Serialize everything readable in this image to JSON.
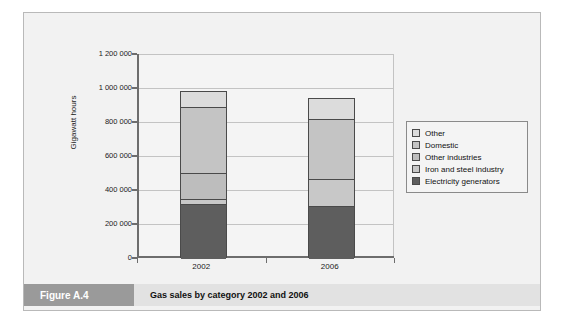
{
  "caption": {
    "tag": "Figure A.4",
    "text": "Gas sales by category 2002 and 2006"
  },
  "chart_data": {
    "type": "bar",
    "subtype": "stacked-vertical",
    "title": "Gas sales by category 2002 and 2006",
    "xlabel": "",
    "ylabel": "Gigawatt hours",
    "categories": [
      "2002",
      "2006"
    ],
    "ylim": [
      0,
      1200000
    ],
    "yticks": [
      0,
      200000,
      400000,
      600000,
      800000,
      1000000,
      1200000
    ],
    "ytick_labels": [
      "0",
      "200 000",
      "400 000",
      "600 000",
      "800 000",
      "1 000 000",
      "1 200 000"
    ],
    "grid": true,
    "legend_position": "right",
    "series": [
      {
        "name": "Electricity generators",
        "color": "#5e5e5e",
        "values": [
          326000,
          312000
        ]
      },
      {
        "name": "Iron and steel industry",
        "color": "#c8c8c8",
        "values": [
          29000,
          160000
        ]
      },
      {
        "name": "Other industries",
        "color": "#bdbdbd",
        "values": [
          149000,
          0
        ]
      },
      {
        "name": "Domestic",
        "color": "#c4c4c4",
        "values": [
          388000,
          350000
        ]
      },
      {
        "name": "Other",
        "color": "#dcdcdc",
        "values": [
          93000,
          117000
        ]
      }
    ],
    "totals": [
      985000,
      939000
    ],
    "legend_order": [
      "Other",
      "Domestic",
      "Other industries",
      "Iron and steel industry",
      "Electricity generators"
    ]
  },
  "legend": {
    "items": [
      {
        "label": "Other",
        "color": "#dcdcdc"
      },
      {
        "label": "Domestic",
        "color": "#c4c4c4"
      },
      {
        "label": "Other industries",
        "color": "#bdbdbd"
      },
      {
        "label": "Iron and steel industry",
        "color": "#c8c8c8"
      },
      {
        "label": "Electricity generators",
        "color": "#5e5e5e"
      }
    ]
  }
}
